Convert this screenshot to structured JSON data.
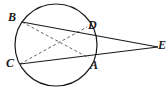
{
  "figure": {
    "kind": "geometry-diagram",
    "width": 168,
    "height": 91,
    "background_color": "#ffffff",
    "stroke_color": "#1a1a1a",
    "dash_color": "#555555",
    "label_color": "#1a1a1a"
  },
  "circle": {
    "name": "main-circle",
    "cx": 56,
    "cy": 45,
    "r": 41,
    "stroke_width": 1.2
  },
  "points": [
    {
      "id": "B",
      "label": "B",
      "x": 22,
      "y": 22,
      "label_x": 8,
      "label_y": 11,
      "on_circle": true
    },
    {
      "id": "D",
      "label": "D",
      "x": 87,
      "y": 27,
      "label_x": 88,
      "label_y": 19,
      "on_circle": true
    },
    {
      "id": "A",
      "label": "A",
      "x": 89,
      "y": 58,
      "label_x": 90,
      "label_y": 59,
      "on_circle": true
    },
    {
      "id": "C",
      "label": "C",
      "x": 20,
      "y": 64,
      "label_x": 6,
      "label_y": 57,
      "on_circle": true
    },
    {
      "id": "E",
      "label": "E",
      "x": 158,
      "y": 47,
      "label_x": 158,
      "label_y": 39,
      "on_circle": false
    }
  ],
  "solid_segments": [
    {
      "id": "BE",
      "from": "B",
      "to": "E",
      "x1": 22,
      "y1": 22,
      "x2": 158,
      "y2": 47
    },
    {
      "id": "CE",
      "from": "C",
      "to": "E",
      "x1": 20,
      "y1": 64,
      "x2": 158,
      "y2": 47
    }
  ],
  "dashed_segments": [
    {
      "id": "BA",
      "from": "B",
      "to": "A",
      "x1": 22,
      "y1": 22,
      "x2": 89,
      "y2": 58
    },
    {
      "id": "CD",
      "from": "C",
      "to": "D",
      "x1": 20,
      "y1": 64,
      "x2": 87,
      "y2": 27
    }
  ],
  "chart_data": {
    "type": "scatter",
    "title": "",
    "xlabel": "",
    "ylabel": "",
    "labels": [
      "B",
      "D",
      "A",
      "C",
      "E"
    ],
    "x": [
      22,
      87,
      89,
      20,
      158
    ],
    "y": [
      22,
      27,
      58,
      64,
      47
    ]
  }
}
